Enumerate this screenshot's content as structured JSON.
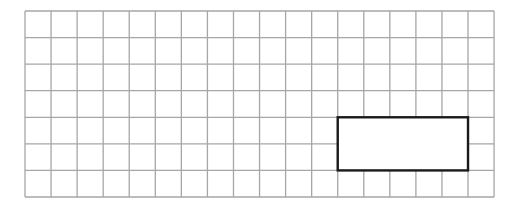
{
  "grid": {
    "left": 25,
    "top": 11,
    "columns": 18,
    "rows": 7,
    "cell_width": 26.06,
    "cell_height": 26.57,
    "line_color": "#a6a6a6",
    "line_width": 1.3
  },
  "rectangle": {
    "col_start": 12,
    "row_start": 4,
    "col_span": 5,
    "row_span": 2,
    "stroke_color": "#1a1a1a",
    "stroke_width": 2.4,
    "fill": "#ffffff"
  }
}
